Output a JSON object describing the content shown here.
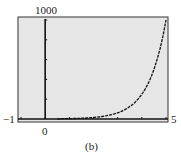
{
  "labels": {
    "ymax": "1000",
    "xmin": "−1",
    "xmax": "5",
    "origin": "0",
    "caption": "(b)"
  },
  "colors": {
    "plot_bg": "#e6e6e6",
    "frame": "#333333",
    "axis": "#111111",
    "curve": "#111111"
  },
  "chart_data": {
    "type": "line",
    "title": "",
    "caption": "(b)",
    "xlabel": "",
    "ylabel": "",
    "xlim": [
      -1,
      5
    ],
    "ylim": [
      0,
      1000
    ],
    "x_tick_labels": [
      "-1",
      "0",
      "5"
    ],
    "y_tick_labels": [
      "1000"
    ],
    "x_tick_step": 1,
    "y_tick_step": 200,
    "grid": false,
    "legend": null,
    "series": [
      {
        "name": "exponential curve",
        "style": "dotted/stepped calculator plot",
        "x": [
          0.5,
          1,
          1.5,
          2,
          2.5,
          3,
          3.5,
          4,
          4.5,
          5
        ],
        "y": [
          2,
          4,
          8,
          16,
          32,
          64,
          128,
          256,
          512,
          1000
        ]
      }
    ]
  }
}
